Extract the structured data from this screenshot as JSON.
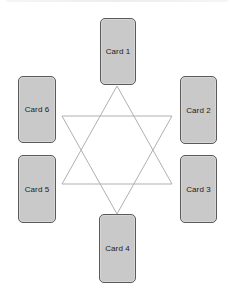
{
  "diagram": {
    "type": "card-spread",
    "shape": "six-pointed-star",
    "colors": {
      "background": "#ffffff",
      "card_fill": "#c9c9c9",
      "card_border": "#5a5a5a",
      "card_text": "#222222",
      "star_line": "#b0b0b0"
    },
    "cards": [
      {
        "label": "Card 1",
        "position": "top"
      },
      {
        "label": "Card 2",
        "position": "upper-right"
      },
      {
        "label": "Card 3",
        "position": "lower-right"
      },
      {
        "label": "Card 4",
        "position": "bottom"
      },
      {
        "label": "Card 5",
        "position": "lower-left"
      },
      {
        "label": "Card 6",
        "position": "upper-left"
      }
    ]
  }
}
